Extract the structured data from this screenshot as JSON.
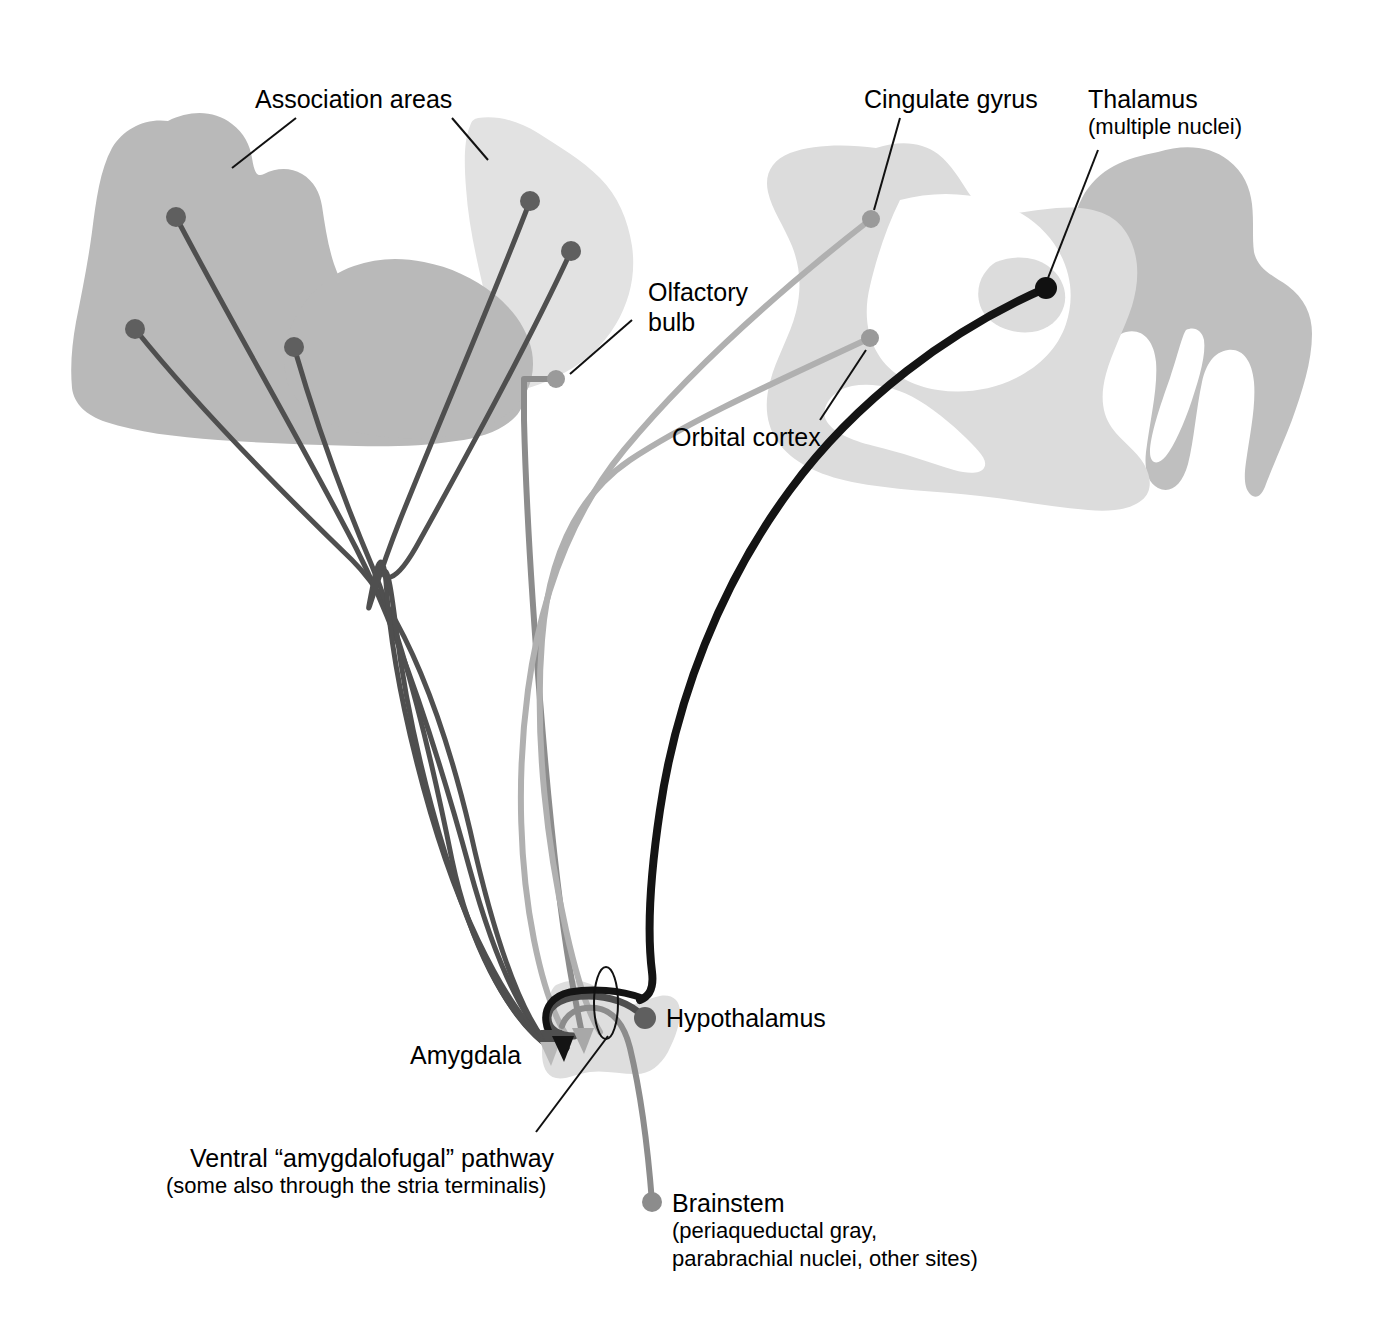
{
  "figure": {
    "background_color": "#ffffff",
    "palette": {
      "cortex_medium_gray": "#b9b9b9",
      "cortex_light_gray": "#e2e2e2",
      "sagittal_light_gray": "#dcdcdc",
      "sagittal_medium_gray": "#bfbfbf",
      "amygdala_gray": "#dedede",
      "dot_dark_gray": "#5f5f5f",
      "dot_mid_gray": "#9a9a9a",
      "dot_black": "#111111",
      "path_dark_gray": "#4f4f4f",
      "path_mid_gray": "#8c8c8c",
      "path_light_gray": "#b0b0b0",
      "path_black": "#141414",
      "leader_line": "#111111"
    }
  },
  "labels": {
    "association_areas": "Association areas",
    "olfactory_bulb_line1": "Olfactory",
    "olfactory_bulb_line2": "bulb",
    "orbital_cortex": "Orbital cortex",
    "cingulate_gyrus": "Cingulate gyrus",
    "thalamus_line1": "Thalamus",
    "thalamus_line2": "(multiple nuclei)",
    "amygdala": "Amygdala",
    "hypothalamus": "Hypothalamus",
    "ventral_pathway_line1": "Ventral “amygdalofugal” pathway",
    "ventral_pathway_line2": "(some also through the stria terminalis)",
    "brainstem_line1": "Brainstem",
    "brainstem_line2": "(periaqueductal gray,",
    "brainstem_line3": "parabrachial nuclei, other sites)"
  },
  "structures": [
    {
      "name": "association-areas-lateral-cortex",
      "shade": "medium-gray",
      "side": "left"
    },
    {
      "name": "association-areas-frontal-cortex",
      "shade": "light-gray",
      "side": "left"
    },
    {
      "name": "temporal-lobe-lobule",
      "shade": "medium-gray",
      "side": "left"
    },
    {
      "name": "medial-sagittal-brain",
      "shade": "light-gray",
      "side": "right"
    },
    {
      "name": "brainstem-cerebellum-mass",
      "shade": "medium-gray",
      "side": "right"
    },
    {
      "name": "thalamus-nucleus",
      "shade": "light-gray",
      "side": "right"
    },
    {
      "name": "amygdala-body",
      "shade": "very-light-gray",
      "side": "center-bottom"
    }
  ],
  "terminals": [
    {
      "name": "assoc-dot-1",
      "x": 176,
      "y": 217,
      "color": "dark-gray",
      "r": 10
    },
    {
      "name": "assoc-dot-2",
      "x": 135,
      "y": 329,
      "color": "dark-gray",
      "r": 10
    },
    {
      "name": "assoc-dot-3",
      "x": 294,
      "y": 347,
      "color": "dark-gray",
      "r": 10
    },
    {
      "name": "assoc-dot-4",
      "x": 530,
      "y": 201,
      "color": "dark-gray",
      "r": 10
    },
    {
      "name": "assoc-dot-5",
      "x": 571,
      "y": 251,
      "color": "dark-gray",
      "r": 10
    },
    {
      "name": "olfactory-bulb-dot",
      "x": 556,
      "y": 379,
      "color": "mid-gray",
      "r": 9
    },
    {
      "name": "cingulate-gyrus-dot",
      "x": 871,
      "y": 219,
      "color": "mid-gray",
      "r": 9
    },
    {
      "name": "orbital-cortex-dot",
      "x": 870,
      "y": 338,
      "color": "mid-gray",
      "r": 9
    },
    {
      "name": "thalamus-dot",
      "x": 1046,
      "y": 288,
      "color": "black",
      "r": 11
    },
    {
      "name": "hypothalamus-dot",
      "x": 645,
      "y": 1018,
      "color": "dark-gray",
      "r": 11
    },
    {
      "name": "brainstem-dot",
      "x": 652,
      "y": 1202,
      "color": "mid-gray",
      "r": 10
    }
  ],
  "pathways": [
    {
      "name": "assoc-to-amygdala-1",
      "color": "path-dark-gray",
      "width": 5
    },
    {
      "name": "assoc-to-amygdala-2",
      "color": "path-dark-gray",
      "width": 5
    },
    {
      "name": "assoc-to-amygdala-3",
      "color": "path-dark-gray",
      "width": 5
    },
    {
      "name": "assoc-to-amygdala-4",
      "color": "path-dark-gray",
      "width": 5
    },
    {
      "name": "assoc-to-amygdala-5",
      "color": "path-dark-gray",
      "width": 5
    },
    {
      "name": "olfactory-bulb-to-amygdala",
      "color": "path-mid-gray",
      "width": 6
    },
    {
      "name": "cingulate-to-amygdala",
      "color": "path-light-gray",
      "width": 6
    },
    {
      "name": "orbital-cortex-to-amygdala",
      "color": "path-light-gray",
      "width": 6
    },
    {
      "name": "amygdala-to-thalamus",
      "color": "path-black",
      "width": 8
    },
    {
      "name": "amygdala-to-hypothalamus",
      "color": "path-dark-gray",
      "width": 7
    },
    {
      "name": "amygdala-to-brainstem",
      "color": "path-mid-gray",
      "width": 6
    }
  ],
  "annotations": {
    "ventral_pathway_marker": "thin-ellipse-outline",
    "leader_lines": 7
  }
}
